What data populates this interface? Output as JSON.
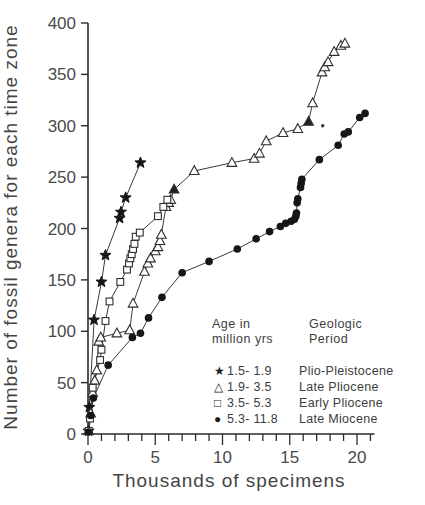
{
  "figure": {
    "y_axis_title": "Number of fossil genera for each time zone",
    "x_axis_title": "Thousands of specimens"
  },
  "legend": {
    "age_header_line1": "Age in",
    "age_header_line2": "million yrs",
    "period_header_line1": "Geologic",
    "period_header_line2": "Period",
    "items": [
      {
        "marker": "star",
        "glyph": "★",
        "age": "1.5- 1.9",
        "period": "Plio-Pleistocene"
      },
      {
        "marker": "triangle",
        "glyph": "△",
        "age": "1.9- 3.5",
        "period": "Late Pliocene"
      },
      {
        "marker": "square",
        "glyph": "□",
        "age": "3.5- 5.3",
        "period": "Early Pliocene"
      },
      {
        "marker": "circle",
        "glyph": "●",
        "age": "5.3- 11.8",
        "period": "Late Miocene"
      }
    ]
  },
  "chart_data": {
    "type": "line",
    "title": "",
    "xlabel": "Thousands of specimens",
    "ylabel": "Number of fossil genera for each time zone",
    "xlim": [
      0,
      21
    ],
    "ylim": [
      0,
      400
    ],
    "x_major_ticks": [
      0,
      5,
      10,
      15,
      20
    ],
    "x_minor_tick_step": 1,
    "y_major_ticks": [
      0,
      50,
      100,
      150,
      200,
      250,
      300,
      350,
      400
    ],
    "grid": false,
    "legend_position": "inside lower-right",
    "ink_color": "#2b2b2b",
    "series": [
      {
        "name": "Plio-Pleistocene",
        "age_range": "1.5-1.9",
        "marker": "star",
        "points": [
          [
            0.05,
            3
          ],
          [
            0.1,
            26
          ],
          [
            0.45,
            111
          ],
          [
            1.0,
            148
          ],
          [
            1.3,
            174
          ],
          [
            2.35,
            210
          ],
          [
            2.45,
            216
          ],
          [
            2.8,
            230
          ],
          [
            3.9,
            264
          ]
        ]
      },
      {
        "name": "Late Pliocene",
        "age_range": "1.9-3.5",
        "marker": "triangle",
        "points": [
          [
            0.05,
            3
          ],
          [
            0.2,
            20
          ],
          [
            0.35,
            40
          ],
          [
            0.5,
            52
          ],
          [
            0.65,
            62
          ],
          [
            0.8,
            90
          ],
          [
            0.95,
            94
          ],
          [
            2.15,
            98
          ],
          [
            3.1,
            101
          ],
          [
            3.35,
            127
          ],
          [
            4.2,
            158
          ],
          [
            4.45,
            166
          ],
          [
            4.65,
            171
          ],
          [
            5.0,
            178
          ],
          [
            5.2,
            182
          ],
          [
            5.35,
            188
          ],
          [
            5.45,
            194
          ],
          [
            5.8,
            221
          ],
          [
            6.0,
            225
          ],
          [
            6.15,
            228
          ],
          [
            6.4,
            238,
            1
          ],
          [
            7.9,
            256
          ],
          [
            10.7,
            264
          ],
          [
            12.35,
            268
          ],
          [
            12.75,
            273
          ],
          [
            13.25,
            285
          ],
          [
            14.5,
            293
          ],
          [
            15.6,
            297
          ],
          [
            16.4,
            304,
            1
          ],
          [
            16.7,
            322
          ],
          [
            17.4,
            352
          ],
          [
            17.6,
            357
          ],
          [
            17.85,
            362
          ],
          [
            18.3,
            372
          ],
          [
            18.8,
            378
          ],
          [
            19.1,
            380
          ]
        ]
      },
      {
        "name": "Early Pliocene",
        "age_range": "3.5-5.3",
        "marker": "square",
        "points": [
          [
            0.05,
            3
          ],
          [
            0.15,
            15
          ],
          [
            0.35,
            45
          ],
          [
            0.9,
            72
          ],
          [
            1.0,
            82
          ],
          [
            1.3,
            110
          ],
          [
            1.6,
            129
          ],
          [
            2.4,
            148
          ],
          [
            2.9,
            160
          ],
          [
            3.05,
            166
          ],
          [
            3.15,
            171
          ],
          [
            3.25,
            175
          ],
          [
            3.35,
            180
          ],
          [
            3.45,
            185
          ],
          [
            3.55,
            192
          ],
          [
            3.85,
            196
          ],
          [
            5.2,
            212
          ],
          [
            5.6,
            221
          ],
          [
            5.9,
            228
          ]
        ]
      },
      {
        "name": "Late Miocene",
        "age_range": "5.3-11.8",
        "marker": "circle",
        "points": [
          [
            0.05,
            2
          ],
          [
            0.2,
            18
          ],
          [
            0.4,
            35
          ],
          [
            1.5,
            67
          ],
          [
            3.3,
            94
          ],
          [
            3.9,
            98
          ],
          [
            4.5,
            113
          ],
          [
            5.5,
            133
          ],
          [
            7.0,
            157
          ],
          [
            9.0,
            168
          ],
          [
            11.1,
            180
          ],
          [
            12.5,
            190
          ],
          [
            13.5,
            197
          ],
          [
            14.3,
            202
          ],
          [
            14.7,
            205
          ],
          [
            15.1,
            207
          ],
          [
            15.35,
            209
          ],
          [
            15.45,
            212
          ],
          [
            15.5,
            215
          ],
          [
            15.55,
            225
          ],
          [
            15.6,
            229
          ],
          [
            15.8,
            240
          ],
          [
            15.85,
            244
          ],
          [
            15.9,
            248
          ],
          [
            17.2,
            267
          ],
          [
            18.6,
            281
          ],
          [
            19.05,
            292
          ],
          [
            19.35,
            294
          ],
          [
            20.2,
            308
          ],
          [
            20.6,
            312
          ]
        ]
      }
    ],
    "stray_dot": [
      17.45,
      300
    ]
  }
}
